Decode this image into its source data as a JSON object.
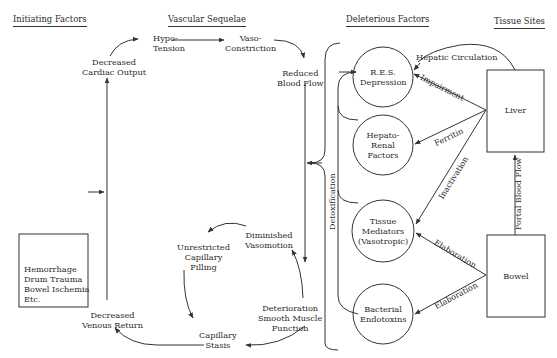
{
  "headers": {
    "initiating": "Initiating Factors",
    "vascular": "Vascular Sequelae",
    "deleterious": "Deleterious Factors",
    "tissue": "Tissue Sites"
  },
  "initiating_box": {
    "lines": [
      "Hemorrhage",
      "Drum Trauma",
      "Bowel Ischemia",
      "Etc."
    ]
  },
  "vascular": {
    "decreased_cardiac_output": [
      "Decreased",
      "Cardiac Output"
    ],
    "hypotension": [
      "Hypo-",
      "Tension"
    ],
    "vasoconstriction": [
      "Vaso-",
      "Constriction"
    ],
    "reduced_blood_flow": [
      "Reduced",
      "Blood Flow"
    ],
    "diminished_vasomotion": [
      "Diminished",
      "Vasomotion"
    ],
    "unrestricted_capillary_filling": [
      "Unrestricted",
      "Capillary",
      "Filling"
    ],
    "deterioration": [
      "Deterioration",
      "Smooth Muscle",
      "Function"
    ],
    "capillary_stasis": [
      "Capillary",
      "Stasis"
    ],
    "decreased_venous_return": [
      "Decreased",
      "Venous Return"
    ]
  },
  "deleterious": {
    "res_depression": [
      "R.E.S.",
      "Depression"
    ],
    "hepato_renal": [
      "Hepato-",
      "Renal",
      "Factors"
    ],
    "tissue_mediators": [
      "Tissue",
      "Mediators",
      "(Vasotropic)"
    ],
    "bacterial_endotoxins": [
      "Bacterial",
      "Endotoxins"
    ],
    "detoxification": "Detoxification"
  },
  "tissue_sites": {
    "liver": "Liver",
    "bowel": "Bowel"
  },
  "edge_labels": {
    "hepatic_circulation": "Hepatic Circulation",
    "impairment": "Impairment",
    "ferritin": "Ferritin",
    "inactivation": "Inactivation",
    "elaboration_1": "Elaboration",
    "elaboration_2": "Elaboration",
    "portal_blood_flow": "Portal Blood Flow"
  }
}
